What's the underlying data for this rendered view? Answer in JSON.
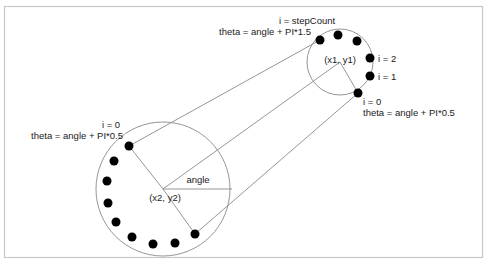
{
  "diagram": {
    "labels": {
      "small_center": "(x1, y1)",
      "big_center": "(x2, y2)",
      "angle": "angle",
      "small_last_index": "i = stepCount",
      "small_last_theta": "theta = angle + PI*1.5",
      "small_i2": "i = 2",
      "small_i1": "i = 1",
      "small_i0": "i = 0",
      "small_i0_theta": "theta = angle + PI*0.5",
      "big_i0": "i = 0",
      "big_i0_theta": "theta = angle + PI*0.5"
    },
    "colors": {
      "frame": "#c8c8c8",
      "line": "#8a8a8a",
      "dot": "#000000",
      "text": "#1a1a1a"
    }
  }
}
